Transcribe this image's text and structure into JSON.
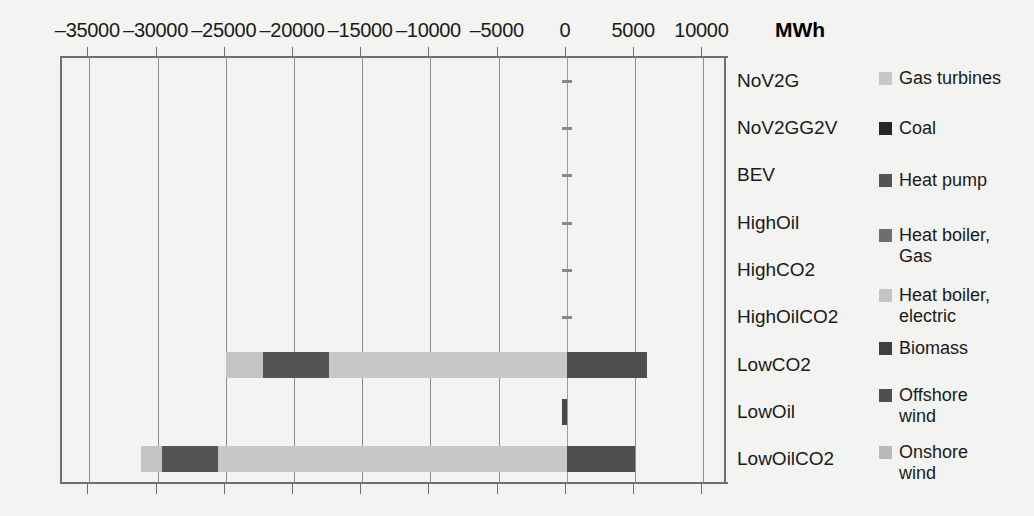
{
  "chart_data": {
    "type": "bar",
    "orientation": "horizontal",
    "stacked": true,
    "title": "",
    "xlabel": "MWh",
    "ylabel": "",
    "unit_label": "MWh",
    "xlim": [
      -37000,
      11800
    ],
    "xticks": [
      -35000,
      -30000,
      -25000,
      -20000,
      -15000,
      -10000,
      -5000,
      0,
      5000,
      10000
    ],
    "xtick_labels": [
      "–35000",
      "–30000",
      "–25000",
      "–20000",
      "–15000",
      "–10000",
      "–5000",
      "0",
      "5000",
      "10000"
    ],
    "grid": true,
    "grid_axis": "x",
    "legend_position": "right",
    "categories": [
      "NoV2G",
      "NoV2GG2V",
      "BEV",
      "HighOil",
      "HighCO2",
      "HighOilCO2",
      "LowCO2",
      "LowOil",
      "LowOilCO2"
    ],
    "series": [
      {
        "name": "Gas turbines",
        "color": "#c8c8c8",
        "values": [
          0,
          0,
          0,
          0,
          0,
          0,
          -17450,
          0,
          -25550
        ]
      },
      {
        "name": "Coal",
        "color": "#262626",
        "values": [
          0,
          0,
          0,
          0,
          0,
          0,
          0,
          0,
          0
        ]
      },
      {
        "name": "Heat pump",
        "color": "#545454",
        "values": [
          0,
          0,
          0,
          0,
          0,
          0,
          -4850,
          0,
          -4100
        ]
      },
      {
        "name": "Heat boiler, Gas",
        "color": "#6e6e6e",
        "values": [
          0,
          0,
          0,
          0,
          0,
          0,
          0,
          0,
          0
        ]
      },
      {
        "name": "Heat boiler, electric",
        "color": "#c4c4c4",
        "values": [
          0,
          0,
          0,
          0,
          0,
          0,
          -2700,
          0,
          -1550
        ]
      },
      {
        "name": "Biomass",
        "color": "#4a4a4a",
        "values": [
          0,
          0,
          0,
          0,
          0,
          0,
          0,
          -350,
          0
        ]
      },
      {
        "name": "Offshore wind",
        "color": "#4f4f4f",
        "values": [
          0,
          0,
          0,
          0,
          0,
          0,
          5900,
          0,
          5000
        ]
      },
      {
        "name": "Onshore wind",
        "color": "#b9b9b9",
        "values": [
          0,
          0,
          0,
          0,
          0,
          0,
          0,
          0,
          0
        ]
      }
    ]
  },
  "axis": {
    "unit": "MWh"
  },
  "legend": {
    "items": [
      {
        "label": "Gas turbines",
        "color": "#c8c8c8"
      },
      {
        "label": "Coal",
        "color": "#262626"
      },
      {
        "label": "Heat pump",
        "color": "#545454"
      },
      {
        "label": "Heat boiler,\nGas",
        "color": "#6e6e6e"
      },
      {
        "label": "Heat boiler,\nelectric",
        "color": "#c4c4c4"
      },
      {
        "label": "Biomass",
        "color": "#3f3f3f"
      },
      {
        "label": "Offshore\nwind",
        "color": "#4f4f4f"
      },
      {
        "label": "Onshore\nwind",
        "color": "#b9b9b9"
      }
    ]
  }
}
